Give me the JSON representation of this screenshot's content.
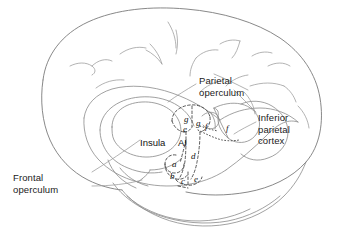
{
  "figure": {
    "kind": "anatomical-line-drawing",
    "background_color": "#ffffff",
    "line_color": "#8a8a8a",
    "dashed_line_color": "#3a3a3a",
    "text_color": "#111111"
  },
  "callout_labels": [
    {
      "id": "parietal-operculum",
      "text": "Parietal\noperculum",
      "x": 199,
      "y": 75
    },
    {
      "id": "inferior-parietal-cortex",
      "text": "Inferior\nparietal\ncortex",
      "x": 258,
      "y": 112
    },
    {
      "id": "frontal-operculum",
      "text": "Frontal\noperculum",
      "x": 13,
      "y": 172
    }
  ],
  "area_labels": [
    {
      "id": "insula",
      "text": "Insula",
      "x": 140,
      "y": 138
    },
    {
      "id": "ai",
      "text": "AI",
      "x": 178,
      "y": 138
    }
  ],
  "region_labels": [
    {
      "id": "region-g-left",
      "text": "g",
      "x": 184,
      "y": 115
    },
    {
      "id": "region-g-right",
      "text": "g",
      "x": 196,
      "y": 119
    },
    {
      "id": "region-e-upper",
      "text": "e",
      "x": 183,
      "y": 125
    },
    {
      "id": "region-f-inner",
      "text": "f",
      "x": 205,
      "y": 122
    },
    {
      "id": "region-f-outer",
      "text": "f",
      "x": 226,
      "y": 124
    },
    {
      "id": "region-d",
      "text": "d",
      "x": 191,
      "y": 152
    },
    {
      "id": "region-a",
      "text": "a",
      "x": 172,
      "y": 160
    },
    {
      "id": "region-b",
      "text": "b",
      "x": 170,
      "y": 172
    },
    {
      "id": "region-c",
      "text": "c",
      "x": 181,
      "y": 177
    },
    {
      "id": "region-e-lower",
      "text": "e",
      "x": 194,
      "y": 175
    }
  ]
}
